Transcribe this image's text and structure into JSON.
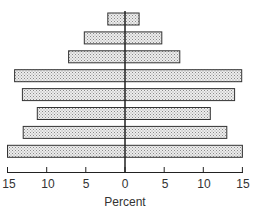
{
  "chart_data": {
    "type": "bar",
    "subtype": "population-pyramid",
    "title": "",
    "xlabel": "Percent",
    "ylabel": "",
    "xlim": [
      -15,
      15
    ],
    "x_ticks": [
      15,
      10,
      5,
      0,
      5,
      10,
      15
    ],
    "grid": false,
    "legend": null,
    "fill_pattern": "stippled",
    "categories": [
      "1",
      "2",
      "3",
      "4",
      "5",
      "6",
      "7",
      "8"
    ],
    "category_order": "top-to-bottom",
    "series": [
      {
        "name": "left",
        "values": [
          2.2,
          5.2,
          7.2,
          14.1,
          13.1,
          11.2,
          13.0,
          15.0
        ]
      },
      {
        "name": "right",
        "values": [
          1.8,
          4.7,
          7.0,
          14.9,
          14.0,
          10.9,
          13.0,
          15.0
        ]
      }
    ]
  },
  "axis": {
    "ticks": [
      "15",
      "10",
      "5",
      "0",
      "5",
      "10",
      "15"
    ],
    "title": "Percent"
  },
  "colors": {
    "bar_fill": "#d4d4d4",
    "bar_stroke": "#333333",
    "axis": "#222222"
  }
}
